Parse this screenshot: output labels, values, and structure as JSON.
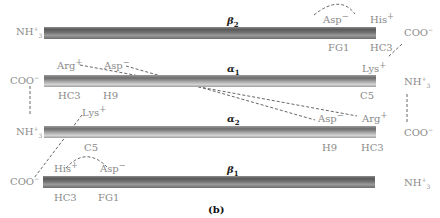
{
  "figure": {
    "caption": "(b)",
    "chains": [
      {
        "id": "beta2",
        "symbol": "β",
        "subscript": "2",
        "left_terminus": "NH3+",
        "right_terminus": "COO−",
        "residues_above": [
          "Asp−",
          "His+"
        ],
        "residues_below": [
          "FG1",
          "HC3"
        ]
      },
      {
        "id": "alpha1",
        "symbol": "α",
        "subscript": "1",
        "left_terminus": "COO−",
        "right_terminus": "NH3+",
        "residues_above": [
          "Arg+",
          "Asp−",
          "Lys+"
        ],
        "residues_below": [
          "HC3",
          "H9",
          "C5"
        ]
      },
      {
        "id": "alpha2",
        "symbol": "α",
        "subscript": "2",
        "left_terminus": "NH3+",
        "right_terminus": "COO−",
        "residues_above": [
          "Lys+",
          "Asp−",
          "Arg+"
        ],
        "residues_below": [
          "C5",
          "H9",
          "HC3"
        ]
      },
      {
        "id": "beta1",
        "symbol": "β",
        "subscript": "1",
        "left_terminus": "COO−",
        "right_terminus": "NH3+",
        "residues_above": [
          "His+",
          "Asp−"
        ],
        "residues_below": [
          "HC3",
          "FG1"
        ]
      }
    ],
    "labels": {
      "nh3": "NH",
      "nh3_sub": "3",
      "nh3_sup": "+",
      "coo": "COO",
      "coo_sup": "−",
      "asp": "Asp",
      "asp_sup": "−",
      "his": "His",
      "his_sup": "+",
      "arg": "Arg",
      "arg_sup": "+",
      "lys": "Lys",
      "lys_sup": "+",
      "fg1": "FG1",
      "hc3": "HC3",
      "h9": "H9",
      "c5": "C5",
      "beta": "β",
      "alpha": "α",
      "s1": "1",
      "s2": "2"
    },
    "colors": {
      "beta_bar": "#6a6a6a",
      "alpha_bar": "#a0a0a0",
      "label": "#8a8a8a",
      "dashed_line": "#555555"
    }
  }
}
